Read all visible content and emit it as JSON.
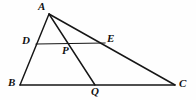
{
  "figure": {
    "background_color": "#fefefe",
    "line_color": "#161616",
    "label_color": "#111111",
    "width": 196,
    "height": 100
  },
  "points": [
    {
      "id": "A",
      "label": "A",
      "x": 49,
      "y": 14,
      "label_x": 38,
      "label_y": 1
    },
    {
      "id": "D",
      "label": "D",
      "x": 36,
      "y": 44,
      "label_x": 22,
      "label_y": 35
    },
    {
      "id": "B",
      "label": "B",
      "x": 20,
      "y": 85,
      "label_x": 8,
      "label_y": 77
    },
    {
      "id": "P",
      "label": "P",
      "x": 69,
      "y": 44,
      "label_x": 62,
      "label_y": 45
    },
    {
      "id": "E",
      "label": "E",
      "x": 105,
      "y": 43,
      "label_x": 107,
      "label_y": 33
    },
    {
      "id": "Q",
      "label": "Q",
      "x": 95,
      "y": 85,
      "label_x": 91,
      "label_y": 86
    },
    {
      "id": "C",
      "label": "C",
      "x": 175,
      "y": 85,
      "label_x": 179,
      "label_y": 78
    }
  ],
  "segments": [
    {
      "id": "AB",
      "from": "A",
      "to": "B",
      "x1": 49,
      "y1": 14,
      "x2": 20,
      "y2": 85
    },
    {
      "id": "BC",
      "from": "B",
      "to": "C",
      "x1": 20,
      "y1": 85,
      "x2": 175,
      "y2": 85
    },
    {
      "id": "AC",
      "from": "A",
      "to": "C",
      "x1": 49,
      "y1": 14,
      "x2": 175,
      "y2": 85
    },
    {
      "id": "DE",
      "from": "D",
      "to": "E",
      "x1": 36,
      "y1": 44,
      "x2": 105,
      "y2": 43
    },
    {
      "id": "AQ",
      "from": "A",
      "to": "Q",
      "x1": 49,
      "y1": 14,
      "x2": 95,
      "y2": 85
    }
  ]
}
